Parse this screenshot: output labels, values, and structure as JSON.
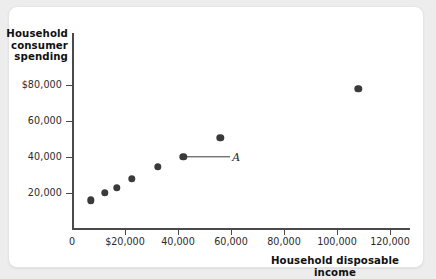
{
  "figure": {
    "card_background": "#ffffff",
    "page_background": "#ededed",
    "point_color": "#3a3a3a",
    "axis_color": "#4a4a4a"
  },
  "chart_data": {
    "type": "scatter",
    "title": "",
    "xlabel": "Household disposable income",
    "ylabel": "Household consumer spending",
    "xlim": [
      0,
      130000
    ],
    "ylim": [
      0,
      90000
    ],
    "xticks": [
      0,
      20000,
      40000,
      60000,
      80000,
      100000,
      120000
    ],
    "xticklabels": [
      "0",
      "$20,000",
      "40,000",
      "60,000",
      "80,000",
      "100,000",
      "120,000"
    ],
    "yticks": [
      20000,
      40000,
      60000,
      80000
    ],
    "yticklabels": [
      "20,000",
      "40,000",
      "60,000",
      "$80,000"
    ],
    "grid": false,
    "legend": null,
    "points": [
      {
        "x": 7200,
        "y": 16000
      },
      {
        "x": 12500,
        "y": 20000
      },
      {
        "x": 17000,
        "y": 23000
      },
      {
        "x": 22500,
        "y": 28000
      },
      {
        "x": 32500,
        "y": 34500
      },
      {
        "x": 42000,
        "y": 40000
      },
      {
        "x": 56000,
        "y": 50500
      },
      {
        "x": 108000,
        "y": 78000
      }
    ],
    "annotations": [
      {
        "label": "A",
        "point_x": 42000,
        "point_y": 40000,
        "label_x": 62000,
        "label_y": 40000
      }
    ]
  }
}
